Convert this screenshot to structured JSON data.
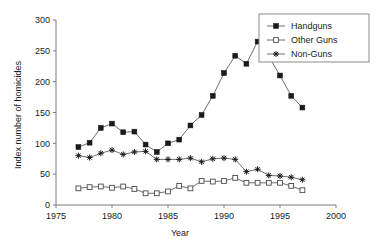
{
  "chart_data": {
    "type": "line",
    "title": "",
    "xlabel": "Year",
    "ylabel": "Index number of homicides",
    "xlim": [
      1975,
      2000
    ],
    "ylim": [
      0,
      300
    ],
    "xticks": [
      1975,
      1980,
      1985,
      1990,
      1995,
      2000
    ],
    "yticks": [
      0,
      50,
      100,
      150,
      200,
      250,
      300
    ],
    "grid": false,
    "legend_position": "top-right",
    "x": [
      1977,
      1978,
      1979,
      1980,
      1981,
      1982,
      1983,
      1984,
      1985,
      1986,
      1987,
      1988,
      1989,
      1990,
      1991,
      1992,
      1993,
      1994,
      1995,
      1996,
      1997
    ],
    "series": [
      {
        "name": "Handguns",
        "marker": "filled-square",
        "values": [
          94,
          101,
          125,
          132,
          118,
          119,
          98,
          86,
          100,
          106,
          129,
          146,
          177,
          214,
          242,
          229,
          265,
          241,
          210,
          177,
          158
        ]
      },
      {
        "name": "Other Guns",
        "marker": "open-square",
        "values": [
          27,
          29,
          30,
          28,
          30,
          26,
          19,
          19,
          22,
          31,
          27,
          39,
          38,
          39,
          44,
          36,
          36,
          36,
          36,
          31,
          24
        ]
      },
      {
        "name": "Non-Guns",
        "marker": "star",
        "values": [
          80,
          77,
          84,
          89,
          82,
          86,
          87,
          74,
          74,
          74,
          76,
          70,
          75,
          76,
          74,
          54,
          58,
          48,
          47,
          45,
          41
        ]
      }
    ]
  },
  "axes": {
    "y_tick_labels": [
      "0",
      "50",
      "100",
      "150",
      "200",
      "250",
      "300"
    ],
    "x_tick_labels": [
      "1975",
      "1980",
      "1985",
      "1990",
      "1995",
      "2000"
    ],
    "x_axis_title": "Year",
    "y_axis_title": "Index number of homicides"
  },
  "legend": {
    "entries": [
      {
        "label": "Handguns"
      },
      {
        "label": "Other Guns"
      },
      {
        "label": "Non-Guns"
      }
    ]
  },
  "colors": {
    "line": "#4a4a4a",
    "marker": "#1a1a1a",
    "axis": "#7a7a7a",
    "background": "#ffffff"
  }
}
